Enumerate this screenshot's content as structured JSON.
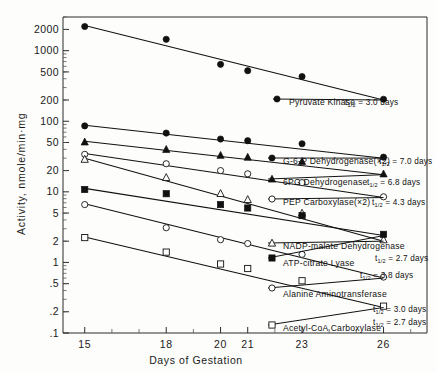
{
  "chart_data": {
    "type": "line",
    "title": "",
    "xlabel": "Days of Gestation",
    "ylabel": "Activity, nmole/min·mg",
    "yscale": "log",
    "ylim": [
      0.1,
      3000
    ],
    "xlim": [
      14.2,
      27.6
    ],
    "grid": false,
    "legend_position": "inline-right",
    "x_ticks": [
      15,
      18,
      20,
      21,
      23,
      26
    ],
    "x_tick_labels": [
      "15",
      "18",
      "20",
      "21",
      "23",
      "26"
    ],
    "y_ticks": [
      2000,
      1000,
      500,
      200,
      100,
      50,
      20,
      10,
      5,
      2,
      1,
      0.5,
      0.2,
      0.1
    ],
    "y_tick_labels": [
      "2000",
      "1000",
      "500",
      "200",
      "100",
      "50",
      "20",
      "10",
      "5",
      "2",
      "1",
      ".5",
      ".2",
      ".1"
    ],
    "series": [
      {
        "name": "Pyruvate Kinase",
        "label": "Pyruvate Kinase",
        "half_life": "3.0 days",
        "half_life_text": "= 3.0 days",
        "marker": "filled-circle",
        "x": [
          15,
          18,
          20,
          21,
          23,
          26
        ],
        "y": [
          2200,
          1450,
          640,
          520,
          430,
          205
        ],
        "fit": [
          [
            15,
            2280
          ],
          [
            26,
            200
          ]
        ]
      },
      {
        "name": "G-6-P Dehydrogenase",
        "label": "G-6-P Dehydrogenase(×2)",
        "half_life": "7.0 days",
        "half_life_text": "= 7.0 days",
        "marker": "filled-circle",
        "x": [
          15,
          18,
          20,
          21,
          23,
          26
        ],
        "y": [
          86,
          68,
          56,
          53,
          48,
          31
        ],
        "fit": [
          [
            15,
            88
          ],
          [
            26,
            30
          ]
        ]
      },
      {
        "name": "6PG Dehydrogenase",
        "label": "6PG Dehydrogenase",
        "half_life": "6.8 days",
        "half_life_text": "= 6.8 days",
        "marker": "filled-triangle",
        "x": [
          15,
          18,
          20,
          21,
          23,
          26
        ],
        "y": [
          51,
          40,
          33,
          31,
          27,
          18
        ],
        "fit": [
          [
            15,
            52
          ],
          [
            26,
            17.5
          ]
        ]
      },
      {
        "name": "PEP Carboxylase",
        "label": "PEP Carboxylase(×2)",
        "half_life": "4.3 days",
        "half_life_text": "= 4.3 days",
        "marker": "open-circle",
        "x": [
          15,
          18,
          20,
          21,
          23,
          26
        ],
        "y": [
          34,
          25,
          20,
          18,
          13.5,
          8.5
        ],
        "fit": [
          [
            15,
            35
          ],
          [
            26,
            8.3
          ]
        ]
      },
      {
        "name": "NADP-malate Dehydrogenase",
        "label": "NADP-malate Dehydrogenase",
        "half_life": "2.7 days",
        "half_life_text": "= 2.7 days",
        "marker": "open-triangle",
        "x": [
          15,
          18,
          20,
          21,
          23,
          26
        ],
        "y": [
          29,
          16,
          9.5,
          7.8,
          5.0,
          2.1
        ],
        "fit": [
          [
            15,
            30
          ],
          [
            26,
            2.0
          ]
        ]
      },
      {
        "name": "ATP-citrate Lyase",
        "label": "ATP-citrate Lyase",
        "half_life": "3.8 days",
        "half_life_text": "= 3.8 days",
        "marker": "filled-square",
        "x": [
          15,
          18,
          20,
          21,
          23,
          26
        ],
        "y": [
          10.8,
          9.4,
          6.6,
          5.9,
          4.6,
          2.5
        ],
        "fit": [
          [
            15,
            11.2
          ],
          [
            26,
            2.4
          ]
        ]
      },
      {
        "name": "Alanine Aminotransferase",
        "label": "Alanine Aminotransferase",
        "half_life": "3.0 days",
        "half_life_text": "= 3.0 days",
        "marker": "open-circle",
        "x": [
          15,
          18,
          20,
          21,
          23,
          26
        ],
        "y": [
          6.6,
          3.1,
          2.1,
          1.85,
          1.3,
          0.62
        ],
        "fit": [
          [
            15,
            6.8
          ],
          [
            26,
            0.6
          ]
        ]
      },
      {
        "name": "Acetyl-CoA Carboxylase",
        "label": "Acetyl-CoA Carboxylase",
        "half_life": "2.7 days",
        "half_life_text": "= 2.7 days",
        "marker": "open-square",
        "x": [
          15,
          18,
          20,
          21,
          23,
          26
        ],
        "y": [
          2.25,
          1.4,
          0.95,
          0.82,
          0.55,
          0.24
        ],
        "fit": [
          [
            15,
            2.3
          ],
          [
            26,
            0.23
          ]
        ]
      }
    ]
  },
  "axes": {
    "x_title": "Days of Gestation",
    "y_title": "Activity, nmole/min·mg"
  },
  "legend_symbol": {
    "t_main": "t",
    "t_sub": "1/2"
  }
}
